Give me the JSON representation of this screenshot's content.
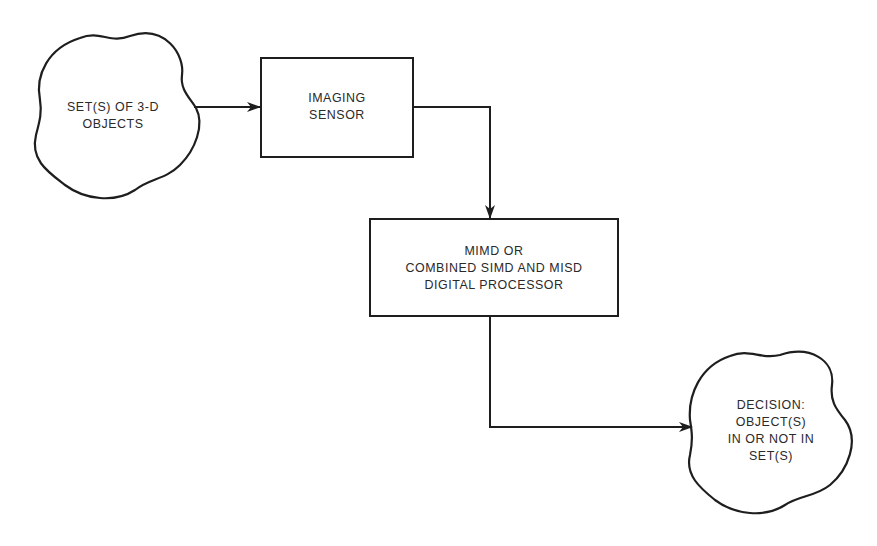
{
  "diagram": {
    "type": "flowchart",
    "colors": {
      "stroke": "#1e1e1e",
      "text": "#2a2a2a",
      "background": "#ffffff"
    },
    "nodes": [
      {
        "id": "input",
        "shape": "cloud",
        "lines": [
          "SET(S) OF 3-D",
          "OBJECTS"
        ]
      },
      {
        "id": "sensor",
        "shape": "rectangle",
        "lines": [
          "IMAGING",
          "SENSOR"
        ]
      },
      {
        "id": "processor",
        "shape": "rectangle",
        "lines": [
          "MIMD OR",
          "COMBINED SIMD AND MISD",
          "DIGITAL PROCESSOR"
        ]
      },
      {
        "id": "decision",
        "shape": "cloud",
        "lines": [
          "DECISION:",
          "OBJECT(S)",
          "IN OR NOT IN",
          "SET(S)"
        ]
      }
    ],
    "edges": [
      {
        "from": "input",
        "to": "sensor"
      },
      {
        "from": "sensor",
        "to": "processor"
      },
      {
        "from": "processor",
        "to": "decision"
      }
    ]
  }
}
